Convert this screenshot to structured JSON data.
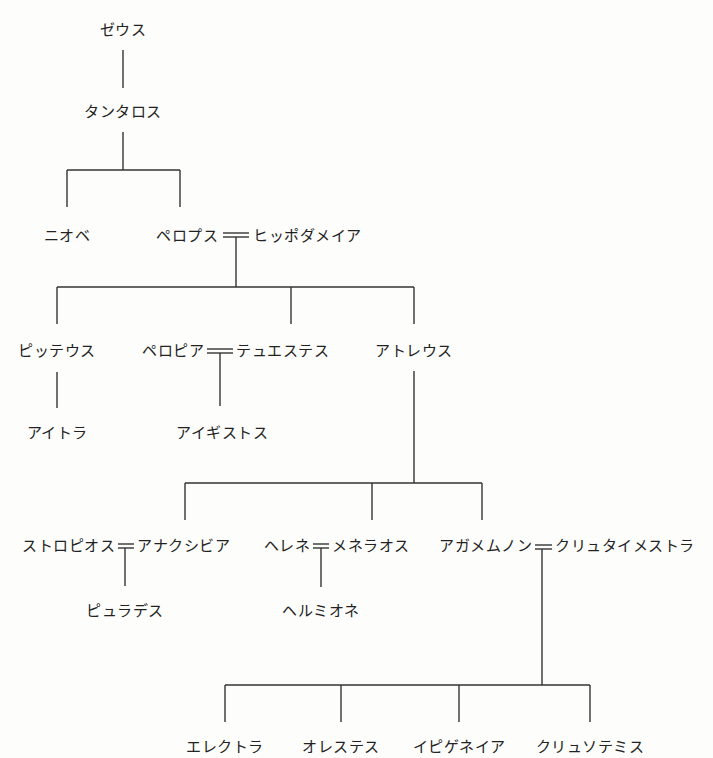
{
  "diagram": {
    "type": "family-tree",
    "people": {
      "zeus": "ゼウス",
      "tantalus": "タンタロス",
      "niobe": "ニオベ",
      "pelops": "ペロプス",
      "hippodamia": "ヒッポダメイア",
      "pittheus": "ピッテウス",
      "pelopia": "ペロピア",
      "thyestes": "テュエステス",
      "atreus": "アトレウス",
      "aethra": "アイトラ",
      "aegisthus": "アイギストス",
      "strophius": "ストロピオス",
      "anaxibia": "アナクシビア",
      "helen": "ヘレネ",
      "menelaus": "メネラオス",
      "agamemnon": "アガメムノン",
      "clytemnestra": "クリュタイメストラ",
      "pylades": "ピュラデス",
      "hermione": "ヘルミオネ",
      "electra": "エレクトラ",
      "orestes": "オレステス",
      "iphigenia": "イピゲネイア",
      "chrysothemis": "クリュソテミス"
    },
    "marriages": [
      [
        "pelops",
        "hippodamia"
      ],
      [
        "pelopia",
        "thyestes"
      ],
      [
        "strophius",
        "anaxibia"
      ],
      [
        "helen",
        "menelaus"
      ],
      [
        "agamemnon",
        "clytemnestra"
      ]
    ],
    "descent": [
      {
        "parents": [
          "zeus"
        ],
        "children": [
          "tantalus"
        ]
      },
      {
        "parents": [
          "tantalus"
        ],
        "children": [
          "niobe",
          "pelops"
        ]
      },
      {
        "parents": [
          "pelops",
          "hippodamia"
        ],
        "children": [
          "pittheus",
          "thyestes",
          "atreus"
        ]
      },
      {
        "parents": [
          "pittheus"
        ],
        "children": [
          "aethra"
        ]
      },
      {
        "parents": [
          "pelopia",
          "thyestes"
        ],
        "children": [
          "aegisthus"
        ]
      },
      {
        "parents": [
          "atreus"
        ],
        "children": [
          "anaxibia",
          "menelaus",
          "agamemnon"
        ]
      },
      {
        "parents": [
          "strophius",
          "anaxibia"
        ],
        "children": [
          "pylades"
        ]
      },
      {
        "parents": [
          "helen",
          "menelaus"
        ],
        "children": [
          "hermione"
        ]
      },
      {
        "parents": [
          "agamemnon",
          "clytemnestra"
        ],
        "children": [
          "electra",
          "orestes",
          "iphigenia",
          "chrysothemis"
        ]
      }
    ]
  }
}
